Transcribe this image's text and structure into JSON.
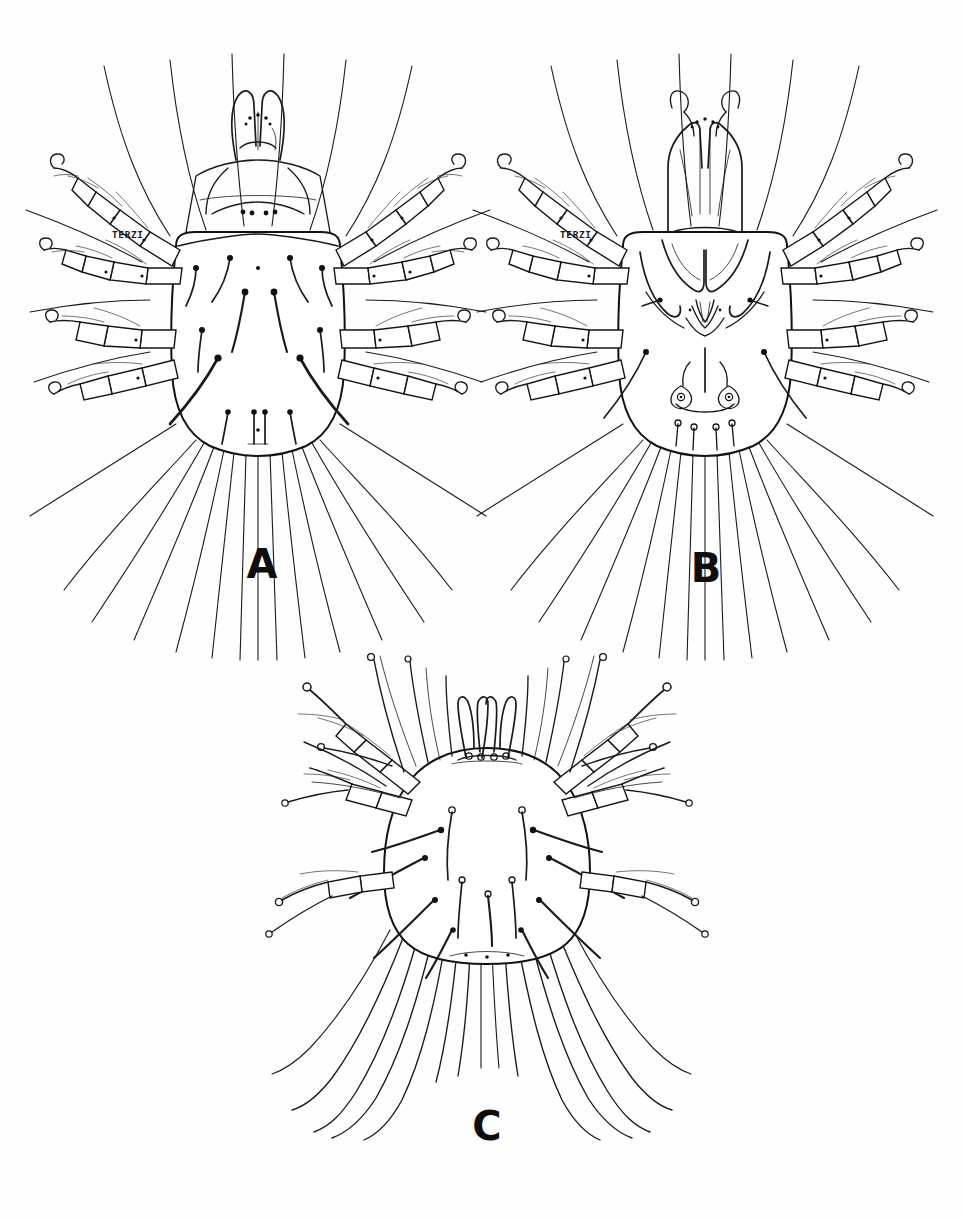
{
  "plate": {
    "type": "scientific-illustration",
    "subject": "mite (Acari) morphology plate",
    "medium": "pen-and-ink line drawing",
    "background_color": "#fefefe",
    "ink_color": "#1a1a1a",
    "width": 962,
    "height": 1218,
    "panel_count": 3
  },
  "panels": [
    {
      "id": "A",
      "label": "A",
      "label_x": 262,
      "label_y": 578,
      "view": "dorsal",
      "stage": "adult",
      "center_x": 258,
      "center_y": 300,
      "signature": "TERZI",
      "signature_x": 112,
      "signature_y": 238,
      "leg_pairs": 4,
      "description": "dorsal habitus with idiosoma, gnathosoma, four pairs of segmented legs and long posterior setae"
    },
    {
      "id": "B",
      "label": "B",
      "label_x": 706,
      "label_y": 582,
      "view": "ventral",
      "stage": "adult male",
      "center_x": 705,
      "center_y": 300,
      "signature": "TERZI",
      "signature_x": 560,
      "signature_y": 238,
      "leg_pairs": 4,
      "description": "ventral habitus showing gnathosoma with palps, epimera, genital region and paired copulatory suckers"
    },
    {
      "id": "C",
      "label": "C",
      "label_x": 487,
      "label_y": 1140,
      "view": "dorsal",
      "stage": "larva",
      "center_x": 487,
      "center_y": 855,
      "signature": "",
      "leg_pairs": 3,
      "description": "smaller rounded larva with knob-tipped setae and very long whip-like trailing setae"
    }
  ],
  "annotations": {
    "signature_text": "TERZI",
    "labels": [
      "A",
      "B",
      "C"
    ]
  }
}
